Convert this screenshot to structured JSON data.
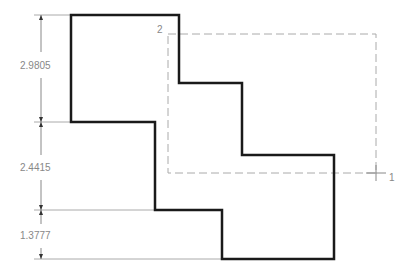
{
  "drawing": {
    "type": "CAD stepped polygon with dimensions",
    "dimensions": [
      {
        "label": "2.9805",
        "from_y": 15,
        "to_y": 122
      },
      {
        "label": "2.4415",
        "from_y": 122,
        "to_y": 210
      },
      {
        "label": "1.3777",
        "from_y": 210,
        "to_y": 259
      }
    ],
    "selection_corners": {
      "corner_1": "1",
      "corner_2": "2"
    },
    "colors": {
      "outline": "#1a1a1a",
      "dimension": "#999999",
      "selection": "#aaaaaa"
    }
  }
}
